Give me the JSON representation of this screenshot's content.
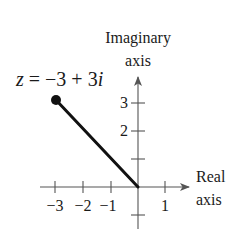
{
  "diagram": {
    "type": "complex-plane",
    "point_label": {
      "var": "z",
      "eq": " = −3 + 3",
      "imag_unit": "i"
    },
    "point": {
      "re": -3,
      "im": 3
    },
    "imaginary_axis_label": {
      "line1": "Imaginary",
      "line2": "axis"
    },
    "real_axis_label": {
      "line1": "Real",
      "line2": "axis"
    },
    "x_ticks": [
      {
        "value": -3,
        "label": "−3"
      },
      {
        "value": -2,
        "label": "−2"
      },
      {
        "value": -1,
        "label": "−1"
      },
      {
        "value": 1,
        "label": "1"
      }
    ],
    "y_ticks": [
      {
        "value": 3,
        "label": "3"
      },
      {
        "value": 2,
        "label": "2"
      },
      {
        "value": 1,
        "label": ""
      },
      {
        "value": -1,
        "label": ""
      }
    ],
    "colors": {
      "ink": "#1a1a1a",
      "axis": "#555555"
    }
  }
}
